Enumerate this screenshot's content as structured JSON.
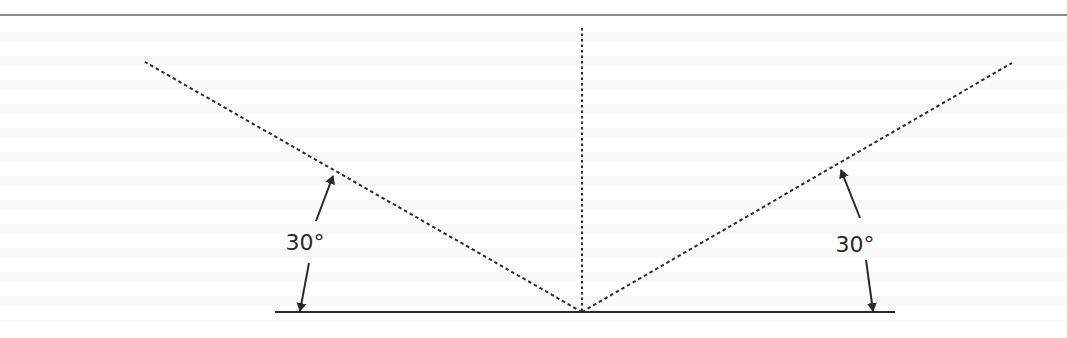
{
  "figure": {
    "colors": {
      "ink": "#2a2a2a",
      "top_rule": "#8a8a8a",
      "background": "#ffffff"
    },
    "labels": {
      "left_angle": "30°",
      "right_angle": "30°"
    },
    "geometry": {
      "top_rule": {
        "x1": 0,
        "y1": 15,
        "x2": 1067,
        "y2": 15
      },
      "surface_line": {
        "x1": 275,
        "y1": 312,
        "x2": 895,
        "y2": 312
      },
      "incidence_point": {
        "x": 582,
        "y": 312
      },
      "normal_line": {
        "x1": 582,
        "y1": 28,
        "x2": 582,
        "y2": 312
      },
      "left_ray": {
        "x1": 582,
        "y1": 312,
        "x2": 145,
        "y2": 62
      },
      "right_ray": {
        "x1": 582,
        "y1": 312,
        "x2": 1012,
        "y2": 63
      },
      "left_angle_label": {
        "x": 305,
        "y": 250
      },
      "right_angle_label": {
        "x": 855,
        "y": 252
      },
      "left_arrow_up": {
        "x1": 316,
        "y1": 221,
        "x2": 333,
        "y2": 176
      },
      "left_arrow_down": {
        "x1": 309,
        "y1": 263,
        "x2": 300,
        "y2": 311
      },
      "right_arrow_up": {
        "x1": 860,
        "y1": 218,
        "x2": 841,
        "y2": 170
      },
      "right_arrow_down": {
        "x1": 866,
        "y1": 260,
        "x2": 873,
        "y2": 311
      }
    },
    "background_text_note": "Faint show-through text from the reverse of the page is present but not legible; not transcribed."
  }
}
